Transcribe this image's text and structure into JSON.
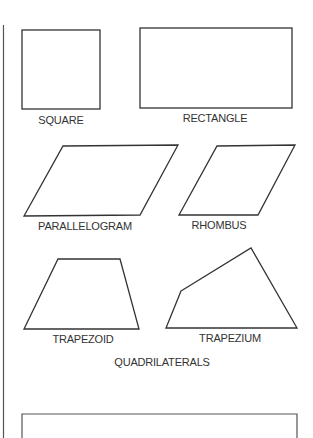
{
  "title": "QUADRILATERALS",
  "shapes": [
    {
      "id": "square",
      "label": "SQUARE"
    },
    {
      "id": "rectangle",
      "label": "RECTANGLE"
    },
    {
      "id": "parallelogram",
      "label": "PARALLELOGRAM"
    },
    {
      "id": "rhombus",
      "label": "RHOMBUS"
    },
    {
      "id": "trapezoid",
      "label": "TRAPEZOID"
    },
    {
      "id": "trapezium",
      "label": "TRAPEZIUM"
    }
  ],
  "colors": {
    "stroke": "#333333",
    "background": "#ffffff"
  }
}
